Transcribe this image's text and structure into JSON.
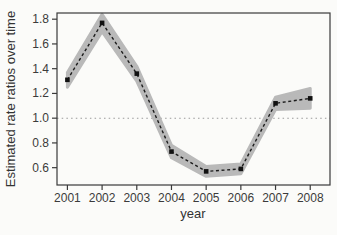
{
  "figure": {
    "background": "#fbfbf9"
  },
  "chart_data": {
    "type": "line",
    "title": "",
    "xlabel": "year",
    "ylabel": "Estimated rate ratios over time",
    "categories": [
      2001,
      2002,
      2003,
      2004,
      2005,
      2006,
      2007,
      2008
    ],
    "series": [
      {
        "name": "estimated-rate-ratio",
        "values": [
          1.31,
          1.77,
          1.36,
          0.73,
          0.57,
          0.59,
          1.12,
          1.16
        ],
        "ci_lower": [
          1.25,
          1.7,
          1.3,
          0.68,
          0.53,
          0.55,
          1.07,
          1.08
        ],
        "ci_upper": [
          1.37,
          1.84,
          1.42,
          0.78,
          0.61,
          0.63,
          1.17,
          1.24
        ]
      }
    ],
    "reference_line_y": 1.0,
    "yticks": [
      0.6,
      0.8,
      1.0,
      1.2,
      1.4,
      1.6,
      1.8
    ],
    "xticks": [
      2001,
      2002,
      2003,
      2004,
      2005,
      2006,
      2007,
      2008
    ],
    "ylim": [
      0.46,
      1.85
    ],
    "xlim": [
      2000.7,
      2008.57
    ],
    "grid": false,
    "legend": "none",
    "line_style": "dashed",
    "marker": "square",
    "colors": {
      "band": "#b9b9b9",
      "line": "#1c1c1c",
      "marker": "#111111",
      "reference_line": "#9a9a9a",
      "axis": "#3a3a3a",
      "tick_label": "#3b3b3b"
    }
  }
}
